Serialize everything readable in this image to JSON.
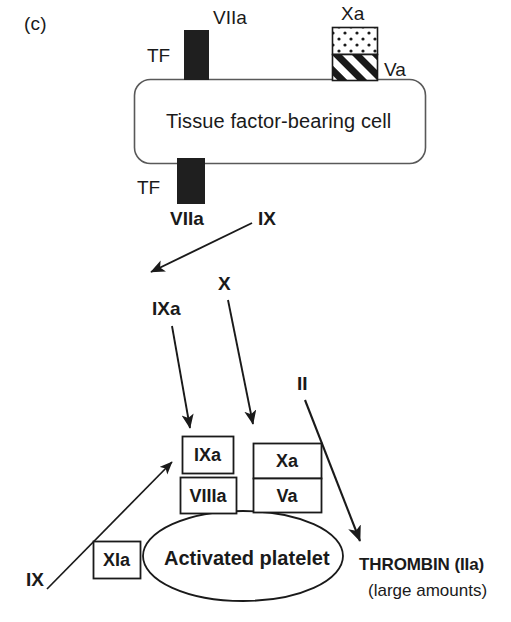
{
  "figure": {
    "panel_letter": "(c)",
    "caption_none": ""
  },
  "cell": {
    "label": "Tissue factor-bearing cell",
    "outline_color": "#4d4d4d",
    "fill_color": "#ffffff"
  },
  "membrane_proteins": {
    "tf_top": {
      "bar_label": "TF",
      "factor_label": "VIIa",
      "fill_color": "#1a1a1a"
    },
    "tf_bottom": {
      "bar_label": "TF",
      "factor_label": "VIIa",
      "fill_color": "#1a1a1a"
    },
    "prothrombinase_top": {
      "upper_label": "Xa",
      "lower_label": "Va",
      "upper_pattern": "dotted",
      "lower_pattern": "diagonal-hatch"
    }
  },
  "free_factors": [
    {
      "id": "ix-top",
      "label": "IX",
      "bold": true
    },
    {
      "id": "ixa-mid",
      "label": "IXa",
      "bold": true
    },
    {
      "id": "x-mid",
      "label": "X",
      "bold": true
    },
    {
      "id": "ii-mid",
      "label": "II",
      "bold": true
    },
    {
      "id": "ix-bottom",
      "label": "IX",
      "bold": true
    }
  ],
  "platelet": {
    "label": "Activated platelet",
    "outline_color": "#1a1a1a"
  },
  "platelet_complexes": {
    "tenase": {
      "enzyme_label": "IXa",
      "cofactor_label": "VIIIa"
    },
    "prothrombinase": {
      "enzyme_label": "Xa",
      "cofactor_label": "Va"
    },
    "xia_box": {
      "label": "XIa"
    }
  },
  "output": {
    "product_label": "THROMBIN (IIa)",
    "amount_label": "(large amounts)"
  },
  "arrows": [
    {
      "id": "ix-to-ixa",
      "from": "IX",
      "to": "IXa",
      "description": "TF/VIIa activates IX"
    },
    {
      "id": "ixa-to-tenase",
      "from": "IXa",
      "to": "IXa/VIIIa complex",
      "description": "IXa joins platelet tenase"
    },
    {
      "id": "x-to-prothrombinase",
      "from": "X",
      "to": "Xa/Va complex",
      "description": "X activated on platelet"
    },
    {
      "id": "ii-to-thrombin",
      "from": "II",
      "to": "THROMBIN (IIa)",
      "description": "Prothrombin converted to thrombin"
    },
    {
      "id": "ix-to-tenase",
      "from": "IX",
      "to": "IXa/VIIIa complex",
      "description": "XIa activates IX on platelet"
    }
  ],
  "colors": {
    "ink": "#1a1a1a",
    "outline_gray": "#4d4d4d",
    "background": "#ffffff"
  }
}
